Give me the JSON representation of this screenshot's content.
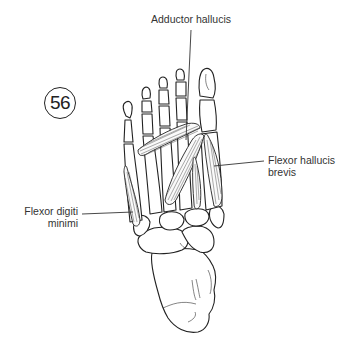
{
  "figure": {
    "number": "56",
    "labels": [
      {
        "id": "adductor-hallucis",
        "text": "Adductor hallucis"
      },
      {
        "id": "flexor-hallucis-brevis",
        "lines": [
          "Flexor hallucis",
          "brevis"
        ]
      },
      {
        "id": "flexor-digiti-minimi",
        "lines": [
          "Flexor digiti",
          "minimi"
        ]
      }
    ]
  },
  "colors": {
    "line": "#222222",
    "text": "#333333",
    "background": "#ffffff"
  }
}
